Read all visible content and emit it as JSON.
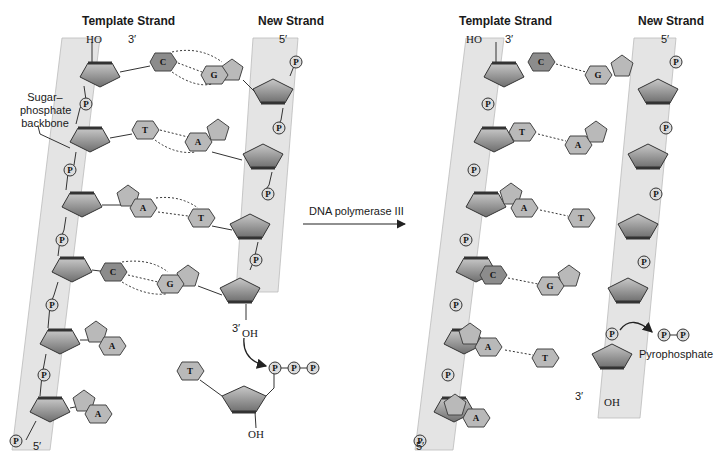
{
  "colors": {
    "backbone_band": "#e4e4e4",
    "sugar_fill": "#8a8a8a",
    "sugar_edge": "#3a3a3a",
    "purine_light": "#b9b9b9",
    "pyrimidine_dark": "#8c8c8c",
    "phosphate": "#dcdcdc",
    "line": "#333333"
  },
  "left_panel": {
    "template_strand_label": "Template Strand",
    "new_strand_label": "New Strand",
    "template_top_hydroxyl": "HO",
    "template_top_end": "3′",
    "new_top_end": "5′",
    "new_bottom_end": "3′",
    "new_bottom_hydroxyl": "OH",
    "template_bottom_end": "5′",
    "backbone_callout": "Sugar–\nphosphate\nbackbone",
    "base_pairs": [
      {
        "template": "C",
        "new": "G"
      },
      {
        "template": "T",
        "new": "A"
      },
      {
        "template": "A",
        "new": "T"
      },
      {
        "template": "C",
        "new": "G"
      }
    ],
    "unpaired_template_bases": [
      "A",
      "A"
    ],
    "incoming_nucleotide": {
      "base": "T",
      "phosphates": [
        "P",
        "P",
        "P"
      ],
      "hydroxyl": "OH"
    },
    "phosphate_label": "P",
    "ring_oxygen": "O"
  },
  "reaction_arrow": {
    "label": "DNA polymerase III"
  },
  "right_panel": {
    "template_strand_label": "Template Strand",
    "new_strand_label": "New Strand",
    "template_top_hydroxyl": "HO",
    "template_top_end": "3′",
    "new_top_end": "5′",
    "new_bottom_end": "3′",
    "new_bottom_hydroxyl": "OH",
    "template_bottom_end": "5′",
    "base_pairs": [
      {
        "template": "C",
        "new": "G"
      },
      {
        "template": "T",
        "new": "A"
      },
      {
        "template": "A",
        "new": "T"
      },
      {
        "template": "C",
        "new": "G"
      },
      {
        "template": "A",
        "new": "T"
      }
    ],
    "unpaired_template_bases": [
      "A"
    ],
    "released_product": {
      "phosphates": [
        "P",
        "P"
      ],
      "label": "Pyrophosphate"
    },
    "phosphate_label": "P",
    "ring_oxygen": "O"
  }
}
